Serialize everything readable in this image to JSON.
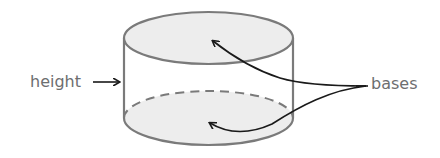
{
  "diagram": {
    "labels": {
      "height": "height",
      "bases": "bases"
    },
    "colors": {
      "outline": "#7a7a7a",
      "base_fill": "#ededed",
      "arrow": "#1a1a1a",
      "label_text": "#6d6e70",
      "background": "#ffffff"
    },
    "annotations": [
      {
        "label": "height",
        "points_to": "cylinder side"
      },
      {
        "label": "bases",
        "points_to": [
          "top base",
          "bottom base"
        ]
      }
    ]
  }
}
